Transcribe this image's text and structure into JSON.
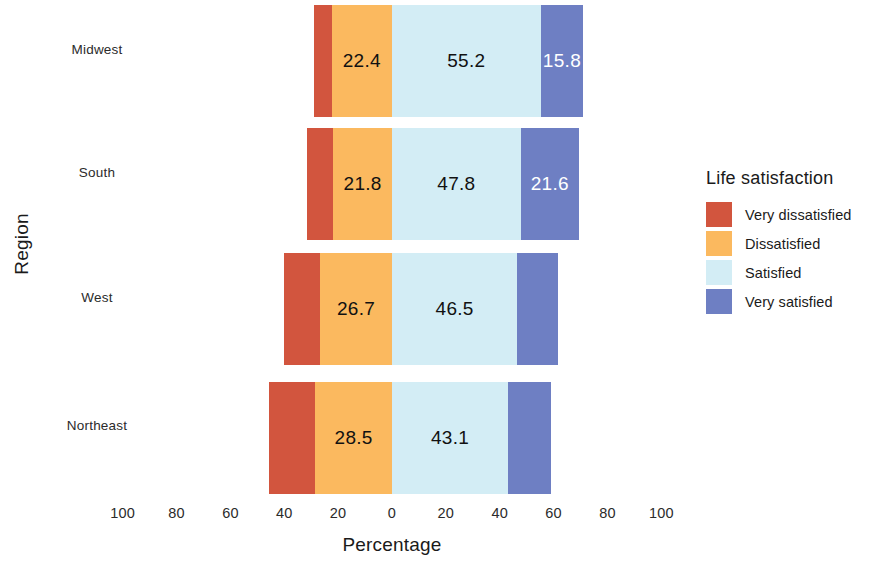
{
  "chart_data": {
    "type": "bar",
    "subtype": "diverging-stacked-horizontal",
    "title": "",
    "xlabel": "Percentage",
    "ylabel": "Region",
    "categories": [
      "Midwest",
      "South",
      "West",
      "Northeast"
    ],
    "legend_title": "Life satisfaction",
    "legend_position": "right",
    "grid": false,
    "xlim": [
      -100,
      100
    ],
    "xticks": [
      "100",
      "80",
      "60",
      "40",
      "20",
      "0",
      "20",
      "40",
      "60",
      "80",
      "100"
    ],
    "xtick_values": [
      -100,
      -80,
      -60,
      -40,
      -20,
      0,
      20,
      40,
      60,
      80,
      100
    ],
    "series": [
      {
        "name": "Very dissatisfied",
        "color": "#D2553E",
        "side": "left",
        "values": [
          6.6,
          9.7,
          13.3,
          17.2
        ],
        "labels": [
          "",
          "",
          "",
          ""
        ]
      },
      {
        "name": "Dissatisfied",
        "color": "#FBB95F",
        "side": "left",
        "values": [
          22.4,
          21.8,
          26.7,
          28.5
        ],
        "labels": [
          "22.4",
          "21.8",
          "26.7",
          "28.5"
        ]
      },
      {
        "name": "Satisfied",
        "color": "#D3EDF5",
        "side": "right",
        "values": [
          55.2,
          47.8,
          46.5,
          43.1
        ],
        "labels": [
          "55.2",
          "47.8",
          "46.5",
          "43.1"
        ]
      },
      {
        "name": "Very satisfied",
        "color": "#6E7FC3",
        "side": "right",
        "values": [
          15.8,
          21.6,
          15.2,
          15.9
        ],
        "labels": [
          "15.8",
          "21.6",
          "",
          ""
        ]
      }
    ],
    "rows": [
      {
        "region": "Midwest",
        "very_dissatisfied": 6.6,
        "dissatisfied": 22.4,
        "satisfied": 55.2,
        "very_satisfied": 15.8
      },
      {
        "region": "South",
        "very_dissatisfied": 9.7,
        "dissatisfied": 21.8,
        "satisfied": 47.8,
        "very_satisfied": 21.6
      },
      {
        "region": "West",
        "very_dissatisfied": 13.3,
        "dissatisfied": 26.7,
        "satisfied": 46.5,
        "very_satisfied": 15.2
      },
      {
        "region": "Northeast",
        "very_dissatisfied": 17.2,
        "dissatisfied": 28.5,
        "satisfied": 43.1,
        "very_satisfied": 15.9
      }
    ]
  },
  "axes": {
    "y_title": "Region",
    "x_title": "Percentage"
  },
  "legend": {
    "title": "Life satisfaction",
    "items": [
      {
        "label": "Very dissatisfied",
        "color": "#D2553E"
      },
      {
        "label": "Dissatisfied",
        "color": "#FBB95F"
      },
      {
        "label": "Satisfied",
        "color": "#D3EDF5"
      },
      {
        "label": "Very satisfied",
        "color": "#6E7FC3"
      }
    ]
  }
}
